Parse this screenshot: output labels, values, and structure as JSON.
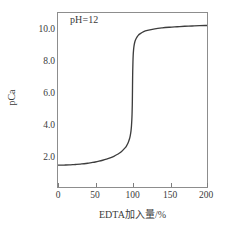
{
  "chart_data": {
    "type": "line",
    "title": "",
    "annotation": "pH=12",
    "xlabel": "EDTA加入量/%",
    "ylabel": "pCa",
    "xlim": [
      0,
      200
    ],
    "ylim": [
      0.6,
      11.6
    ],
    "grid": false,
    "legend": "none",
    "xticks": [
      {
        "value": 0,
        "label": "0"
      },
      {
        "value": 50,
        "label": "50"
      },
      {
        "value": 100,
        "label": "100"
      },
      {
        "value": 150,
        "label": "150"
      },
      {
        "value": 200,
        "label": "200"
      }
    ],
    "yticks": [
      {
        "value": 2.0,
        "label": "2.0"
      },
      {
        "value": 4.0,
        "label": "4.0"
      },
      {
        "value": 6.0,
        "label": "6.0"
      },
      {
        "value": 8.0,
        "label": "8.0"
      },
      {
        "value": 10.0,
        "label": "10.0"
      }
    ],
    "series": [
      {
        "name": "titration-curve",
        "color": "#3d3d3d",
        "x": [
          0,
          5,
          10,
          15,
          20,
          25,
          30,
          35,
          40,
          45,
          50,
          55,
          60,
          65,
          70,
          75,
          80,
          85,
          90,
          92,
          94,
          96,
          97,
          98,
          98.6,
          99.1,
          99.4,
          99.7,
          99.9,
          100,
          100.1,
          100.3,
          100.6,
          100.9,
          101.4,
          102,
          103,
          104,
          106,
          108,
          110,
          115,
          120,
          130,
          140,
          150,
          160,
          170,
          180,
          190,
          200
        ],
        "y": [
          1.98,
          1.98,
          1.99,
          2.0,
          2.01,
          2.03,
          2.05,
          2.07,
          2.1,
          2.14,
          2.18,
          2.23,
          2.29,
          2.36,
          2.44,
          2.54,
          2.67,
          2.83,
          3.07,
          3.2,
          3.38,
          3.65,
          3.85,
          4.15,
          4.45,
          4.85,
          5.2,
          5.75,
          6.4,
          6.85,
          7.3,
          7.95,
          8.5,
          8.9,
          9.25,
          9.5,
          9.75,
          9.9,
          10.08,
          10.2,
          10.28,
          10.42,
          10.5,
          10.6,
          10.66,
          10.7,
          10.73,
          10.76,
          10.78,
          10.8,
          10.81
        ]
      }
    ]
  }
}
